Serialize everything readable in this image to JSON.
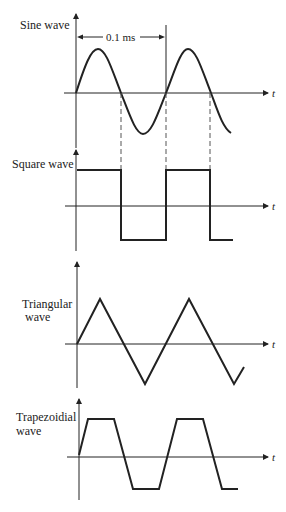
{
  "labels": {
    "sine": "Sine wave",
    "square": "Square wave",
    "triangular_1": "Triangular",
    "triangular_2": "wave",
    "trapezoidial_1": "Trapezoidial",
    "trapezoidial_2": "wave",
    "period": "0.1 ms",
    "time_axis": "t"
  },
  "colors": {
    "ink": "#222222",
    "background": "#ffffff"
  },
  "waveforms": [
    {
      "name": "Sine wave",
      "period": "0.1 ms",
      "cycles": 2.4
    },
    {
      "name": "Square wave",
      "cycles": 2.4
    },
    {
      "name": "Triangular wave",
      "cycles": 2.4
    },
    {
      "name": "Trapezoidial wave",
      "cycles": 2.4
    }
  ]
}
